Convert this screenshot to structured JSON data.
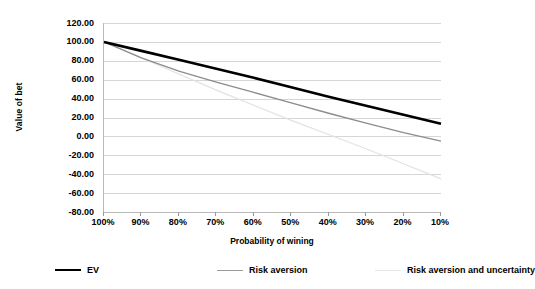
{
  "chart_data": {
    "type": "line",
    "title": "",
    "xlabel": "Probability of wining",
    "ylabel": "Value of bet",
    "categories": [
      "100%",
      "90%",
      "80%",
      "70%",
      "60%",
      "50%",
      "40%",
      "30%",
      "20%",
      "10%"
    ],
    "x_values": [
      100,
      90,
      80,
      70,
      60,
      50,
      40,
      30,
      20,
      10
    ],
    "ylim": [
      -80,
      120
    ],
    "y_ticks": [
      120.0,
      100.0,
      80.0,
      60.0,
      40.0,
      20.0,
      0.0,
      -20.0,
      -40.0,
      -60.0,
      -80.0
    ],
    "y_tick_labels": [
      "120.00",
      "100.00",
      "80.00",
      "60.00",
      "40.00",
      "20.00",
      "0.00",
      "-20.00",
      "-40.00",
      "-60.00",
      "-80.00"
    ],
    "grid": true,
    "legend_position": "bottom",
    "series": [
      {
        "name": "EV",
        "color": "#000000",
        "width": 2.6,
        "values": [
          100.0,
          90.5,
          81.0,
          71.5,
          62.0,
          52.0,
          42.0,
          32.5,
          23.0,
          13.5
        ]
      },
      {
        "name": "Risk aversion",
        "color": "#8c8c8c",
        "width": 1.3,
        "values": [
          100.0,
          83.0,
          69.0,
          57.5,
          46.5,
          35.5,
          24.5,
          14.0,
          4.0,
          -5.0
        ]
      },
      {
        "name": "Risk aversion and uncertainty",
        "color": "#e2e2e2",
        "width": 1.2,
        "values": [
          100.0,
          83.0,
          66.0,
          49.0,
          33.0,
          17.0,
          2.0,
          -13.0,
          -29.0,
          -45.0
        ]
      }
    ]
  },
  "axis": {
    "y_title": "Value of bet",
    "x_title": "Probability of wining"
  },
  "legend": {
    "items": [
      {
        "label": "EV",
        "color": "#000000",
        "thickness": "2.6px"
      },
      {
        "label": "Risk aversion",
        "color": "#9a9a9a",
        "thickness": "1.4px"
      },
      {
        "label": "Risk aversion and uncertainty",
        "color": "#e6e6e6",
        "thickness": "1.4px"
      }
    ]
  }
}
